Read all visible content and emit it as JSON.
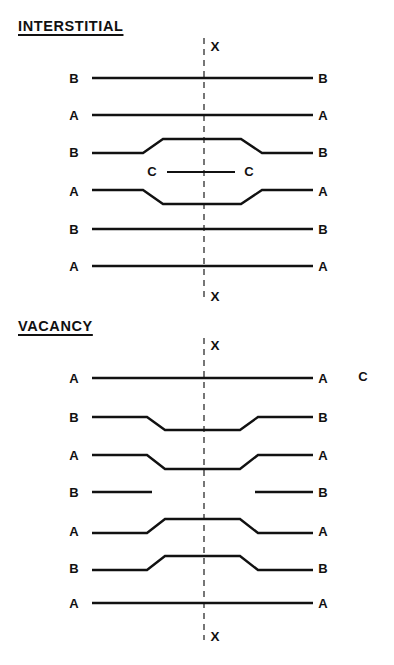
{
  "figure": {
    "background_color": "#ffffff",
    "ink_color": "#111111",
    "axis_color": "#4a4a4a",
    "width": 394,
    "height": 665
  },
  "sections": [
    {
      "id": "interstitial",
      "title": "INTERSTITIAL",
      "title_x": 18,
      "title_y": 26,
      "axis": {
        "x": 204,
        "y_top": 38,
        "y_bottom": 300,
        "top_label": "X",
        "top_label_x": 215,
        "top_label_y": 46,
        "bottom_label": "X",
        "bottom_label_x": 215,
        "bottom_label_y": 296
      },
      "rows": [
        {
          "label_left": "B",
          "label_right": "B",
          "label_left_x": 74,
          "label_right_x": 323,
          "label_y": 78,
          "path": "M 92 78 L 313 78"
        },
        {
          "label_left": "A",
          "label_right": "A",
          "label_left_x": 74,
          "label_right_x": 323,
          "label_y": 115,
          "path": "M 92 115 L 313 115"
        },
        {
          "label_left": "B",
          "label_right": "B",
          "label_left_x": 74,
          "label_right_x": 323,
          "label_y": 152,
          "path": "M 92 153 L 143 153 L 163 139 L 241 139 L 262 153 L 313 153"
        },
        {
          "label_left": "A",
          "label_right": "A",
          "label_left_x": 74,
          "label_right_x": 323,
          "label_y": 191,
          "path": "M 92 190 L 143 190 L 163 204 L 241 204 L 262 190 L 313 190"
        },
        {
          "label_left": "B",
          "label_right": "B",
          "label_left_x": 74,
          "label_right_x": 323,
          "label_y": 229,
          "path": "M 92 229 L 313 229"
        },
        {
          "label_left": "A",
          "label_right": "A",
          "label_left_x": 74,
          "label_right_x": 323,
          "label_y": 266,
          "path": "M 92 266 L 313 266"
        }
      ],
      "extra_features": [
        {
          "name": "interstitial-plane",
          "label_left": "C",
          "label_right": "C",
          "label_left_x": 152,
          "label_right_x": 249,
          "label_y": 171,
          "path": "M 167 172 L 235 172"
        }
      ]
    },
    {
      "id": "vacancy",
      "title": "VACANCY",
      "title_x": 18,
      "title_y": 326,
      "axis": {
        "x": 204,
        "y_top": 338,
        "y_bottom": 640,
        "top_label": "X",
        "top_label_x": 215,
        "top_label_y": 345,
        "bottom_label": "X",
        "bottom_label_x": 215,
        "bottom_label_y": 636
      },
      "rows": [
        {
          "label_left": "A",
          "label_right": "A",
          "label_left_x": 74,
          "label_right_x": 323,
          "label_y": 378,
          "path": "M 92 378 L 313 378"
        },
        {
          "label_left": "B",
          "label_right": "B",
          "label_left_x": 74,
          "label_right_x": 323,
          "label_y": 417,
          "path": "M 92 417 L 147 417 L 165 430 L 240 430 L 258 417 L 313 417"
        },
        {
          "label_left": "A",
          "label_right": "A",
          "label_left_x": 74,
          "label_right_x": 323,
          "label_y": 455,
          "path": "M 92 455 L 147 455 L 165 469 L 240 469 L 258 455 L 313 455"
        },
        {
          "label_left": "B",
          "label_right": "B",
          "label_left_x": 74,
          "label_right_x": 323,
          "label_y": 492,
          "path": "M 92 492 L 152 492 M 255 492 L 313 492",
          "broken": true
        },
        {
          "label_left": "A",
          "label_right": "A",
          "label_left_x": 74,
          "label_right_x": 323,
          "label_y": 531,
          "path": "M 92 533 L 147 533 L 165 519 L 240 519 L 258 533 L 313 533"
        },
        {
          "label_left": "B",
          "label_right": "B",
          "label_left_x": 74,
          "label_right_x": 323,
          "label_y": 568,
          "path": "M 92 570 L 147 570 L 165 556 L 240 556 L 258 570 L 313 570"
        },
        {
          "label_left": "A",
          "label_right": "A",
          "label_left_x": 74,
          "label_right_x": 323,
          "label_y": 603,
          "path": "M 92 603 L 313 603"
        }
      ],
      "extra_features": [
        {
          "name": "stray-label-c",
          "label_left": "C",
          "label_left_x": 363,
          "label_y": 376,
          "path": ""
        }
      ]
    }
  ]
}
